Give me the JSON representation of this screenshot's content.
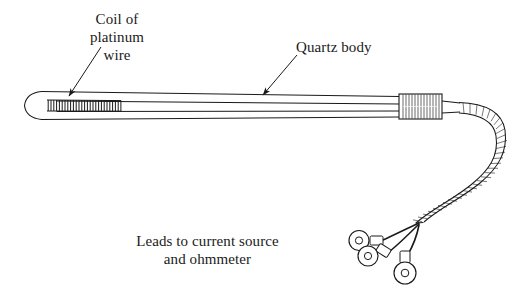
{
  "figure": {
    "background_color": "#ffffff",
    "ink_color": "#1a1a1a",
    "width": 530,
    "height": 299
  },
  "labels": {
    "coil": "Coil of\nplatinum\nwire",
    "quartz": "Quartz body",
    "leads": "Leads to current source\nand ohmmeter"
  },
  "parts": {
    "probe_tip": "rounded-tip",
    "coil": "platinum-wire-coil",
    "body": "quartz-tube-body",
    "ferrule": "ribbed-collar",
    "cable": "braided-lead-cable",
    "terminals": [
      "ring-terminal-1",
      "ring-terminal-2",
      "ring-terminal-3"
    ]
  },
  "leaders": {
    "coil_arrow": "arrow-pointing-down-left-to-coil",
    "quartz_arrow": "arrow-pointing-down-left-to-body"
  }
}
